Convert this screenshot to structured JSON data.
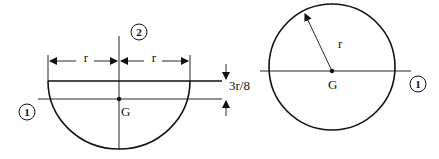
{
  "diagram": {
    "left_figure": {
      "shape": "semicircle",
      "radius_label_left": "r",
      "radius_label_right": "r",
      "offset_label": "3r/8",
      "centroid_label": "G",
      "axis_1_label": "1",
      "axis_2_label": "2"
    },
    "right_figure": {
      "shape": "circle",
      "radius_label": "r",
      "centroid_label": "G",
      "axis_1_label": "1"
    },
    "colors": {
      "line": "#111111",
      "background": "#ffffff"
    }
  }
}
